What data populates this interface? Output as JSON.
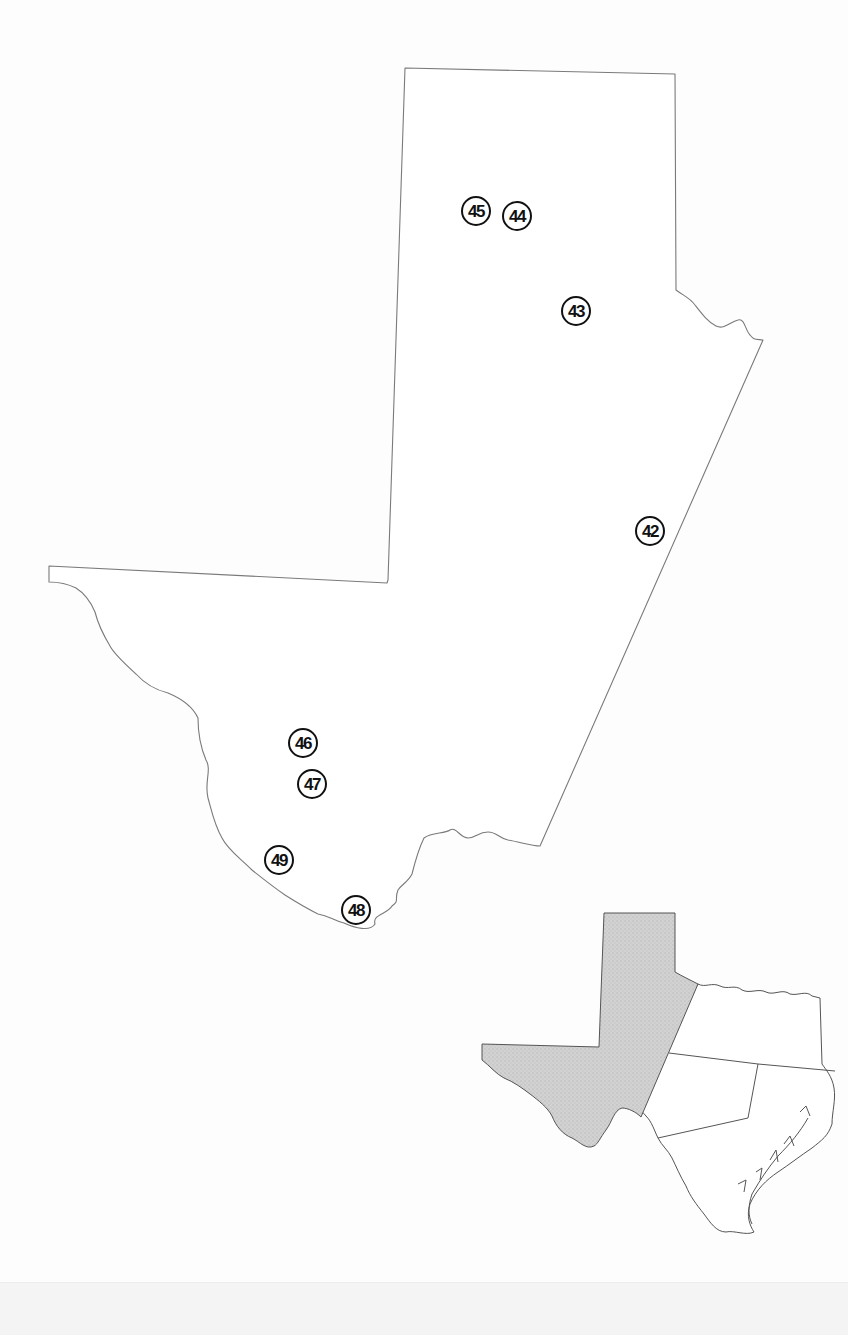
{
  "map": {
    "region": "West Texas (Trans-Pecos and Panhandle)",
    "outline_color": "#7a7a7a",
    "markers": [
      {
        "id": "42",
        "x": 650,
        "y": 531
      },
      {
        "id": "43",
        "x": 576,
        "y": 311
      },
      {
        "id": "44",
        "x": 517,
        "y": 216
      },
      {
        "id": "45",
        "x": 476,
        "y": 211
      },
      {
        "id": "46",
        "x": 303,
        "y": 743
      },
      {
        "id": "47",
        "x": 312,
        "y": 784
      },
      {
        "id": "48",
        "x": 356,
        "y": 910
      },
      {
        "id": "49",
        "x": 279,
        "y": 860
      }
    ]
  },
  "inset": {
    "description": "Texas locator map with highlighted region",
    "highlight_color": "#d0d0d0",
    "highlight_pattern_color": "#bdbdbd"
  }
}
